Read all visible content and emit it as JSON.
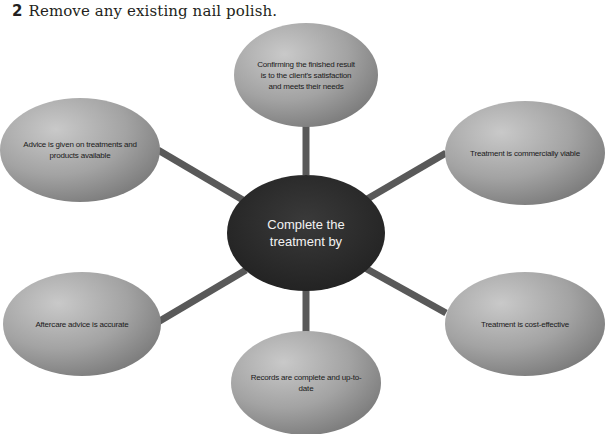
{
  "heading": {
    "number": "2",
    "text": "Remove any existing nail polish."
  },
  "diagram": {
    "center": {
      "label": "Complete the treatment by"
    },
    "nodes": [
      {
        "id": "top",
        "label": "Confirming the finished result is to the client's satisfaction and meets their needs"
      },
      {
        "id": "upper-left",
        "label": "Advice is given on treatments and products available"
      },
      {
        "id": "upper-right",
        "label": "Treatment is commercially viable"
      },
      {
        "id": "lower-left",
        "label": "Aftercare advice is accurate"
      },
      {
        "id": "lower-right",
        "label": "Treatment is cost-effective"
      },
      {
        "id": "bottom",
        "label": "Records are complete and up-to-date"
      }
    ],
    "colors": {
      "center_fill": "#2b2b2b",
      "node_fill_light": "#c4c4c4",
      "node_fill_dark": "#7d7d7d",
      "connector": "#595959"
    }
  }
}
